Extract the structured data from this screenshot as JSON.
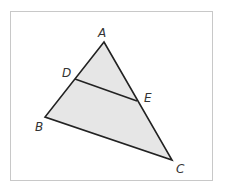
{
  "diagram": {
    "type": "geometry-triangle",
    "colors": {
      "fill": "#e6e6e6",
      "stroke": "#222222",
      "frame": "#c8c8c8",
      "label": "#333333"
    },
    "points": {
      "A": {
        "x": 104,
        "y": 42,
        "label": "A",
        "label_x": 98,
        "label_y": 37
      },
      "B": {
        "x": 45,
        "y": 117,
        "label": "B",
        "label_x": 35,
        "label_y": 131
      },
      "C": {
        "x": 172,
        "y": 160,
        "label": "C",
        "label_x": 176,
        "label_y": 173
      },
      "D": {
        "x": 75,
        "y": 79,
        "label": "D",
        "label_x": 62,
        "label_y": 77
      },
      "E": {
        "x": 137,
        "y": 101,
        "label": "E",
        "label_x": 144,
        "label_y": 102
      }
    },
    "segments": [
      "AB",
      "BC",
      "CA",
      "DE"
    ]
  }
}
